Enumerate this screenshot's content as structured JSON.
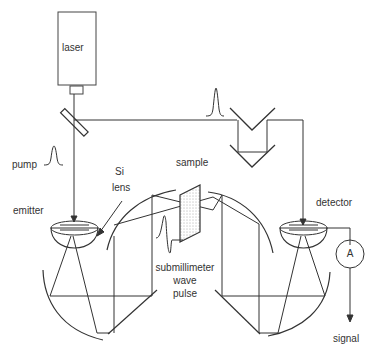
{
  "diagram": {
    "type": "terahertz time-domain spectroscopy setup",
    "colors": {
      "line": "#333333",
      "background": "#ffffff",
      "text": "#333333"
    },
    "labels": {
      "laser": "laser",
      "pump": "pump",
      "si_lens_line1": "Si",
      "si_lens_line2": "lens",
      "sample": "sample",
      "emitter": "emitter",
      "detector": "detector",
      "pulse_line1": "submillimeter",
      "pulse_line2": "wave",
      "pulse_line3": "pulse",
      "ammeter": "A",
      "signal": "signal"
    },
    "components": [
      {
        "name": "laser",
        "shape": "rectangle"
      },
      {
        "name": "beam-splitter",
        "shape": "tilted-plate"
      },
      {
        "name": "delay-line",
        "shape": "retroreflector-pair"
      },
      {
        "name": "emitter",
        "shape": "hemispherical-lens"
      },
      {
        "name": "detector",
        "shape": "hemispherical-lens"
      },
      {
        "name": "sample",
        "shape": "hatched-plate"
      },
      {
        "name": "left-parabolic-mirrors",
        "shape": "arcs"
      },
      {
        "name": "right-parabolic-mirrors",
        "shape": "arcs"
      },
      {
        "name": "ammeter",
        "shape": "circle"
      }
    ],
    "connections": [
      {
        "from": "laser",
        "to": "beam-splitter"
      },
      {
        "from": "beam-splitter",
        "to": "emitter",
        "label": "pump"
      },
      {
        "from": "beam-splitter",
        "to": "delay-line"
      },
      {
        "from": "delay-line",
        "to": "detector"
      },
      {
        "from": "emitter",
        "to": "sample",
        "label": "submillimeter wave pulse"
      },
      {
        "from": "sample",
        "to": "detector"
      },
      {
        "from": "detector",
        "to": "ammeter"
      },
      {
        "from": "ammeter",
        "to": "signal"
      }
    ]
  }
}
